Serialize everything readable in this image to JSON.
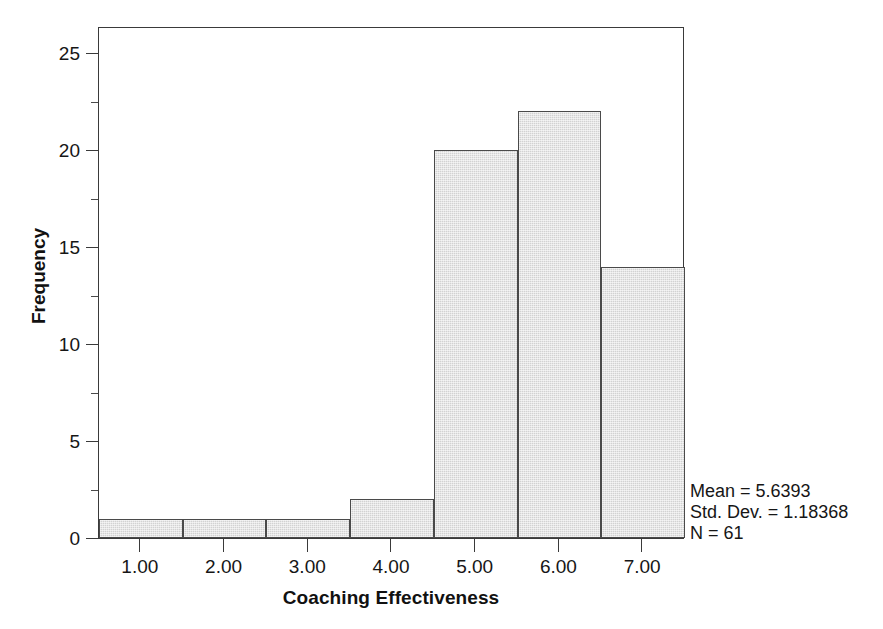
{
  "chart_data": {
    "type": "bar",
    "title": "",
    "subtitle": "",
    "xlabel": "Coaching Effectiveness",
    "ylabel": "Frequency",
    "categories": [
      "1.00",
      "2.00",
      "3.00",
      "4.00",
      "5.00",
      "6.00",
      "7.00"
    ],
    "values": [
      1,
      1,
      1,
      2,
      20,
      22,
      14
    ],
    "x": [
      1,
      2,
      3,
      4,
      5,
      6,
      7
    ],
    "xlim": [
      0.5,
      7.5
    ],
    "ylim": [
      0,
      26.4
    ],
    "ytick_labels": [
      "0",
      "5",
      "10",
      "15",
      "20",
      "25"
    ],
    "ytick_values": [
      0,
      5,
      10,
      15,
      20,
      25
    ],
    "yminor_values": [
      2.5,
      7.5,
      12.5,
      17.5,
      22.5
    ],
    "xtick_labels": [
      "1.00",
      "2.00",
      "3.00",
      "4.00",
      "5.00",
      "6.00",
      "7.00"
    ],
    "grid": false,
    "legend": null,
    "bar_fill_color": "#d2d2d2",
    "bar_edge_color": "#4a4a4a",
    "frame_color": "#3a3a3a",
    "background_color": "#ffffff",
    "annotations": {
      "mean": "Mean = 5.6393",
      "std_dev": "Std. Dev. = 1.18368",
      "n": "N = 61"
    }
  },
  "axes": {
    "y_title": "Frequency",
    "x_title": "Coaching Effectiveness"
  },
  "stats": {
    "mean": "Mean = 5.6393",
    "std_dev": "Std. Dev. = 1.18368",
    "n": "N = 61"
  }
}
